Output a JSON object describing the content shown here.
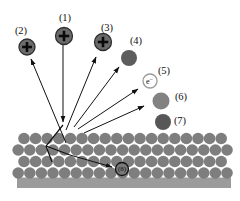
{
  "figure": {
    "background": "#ffffff",
    "width": 240,
    "height": 201,
    "line_color": "#111111",
    "label_font_size": 10.5,
    "labels": [
      {
        "name": "label-1",
        "text": "(1)",
        "x": 65,
        "y": 21
      },
      {
        "name": "label-2",
        "text": "(2)",
        "x": 21,
        "y": 34
      },
      {
        "name": "label-3",
        "text": "(3)",
        "x": 107,
        "y": 31
      },
      {
        "name": "label-4",
        "text": "(4)",
        "x": 136,
        "y": 44
      },
      {
        "name": "label-5",
        "text": "(5)",
        "x": 164,
        "y": 74
      },
      {
        "name": "label-6",
        "text": "(6)",
        "x": 181,
        "y": 100
      },
      {
        "name": "label-7",
        "text": "(7)",
        "x": 180,
        "y": 124
      }
    ],
    "particles": [
      {
        "name": "incident-ion-1",
        "cx": 64,
        "cy": 36,
        "r": 8.5,
        "fill": "#6b6b6b",
        "stroke": "#2f2f2f",
        "symbol": "plus"
      },
      {
        "name": "backscattered-ion-2",
        "cx": 27,
        "cy": 47,
        "r": 8,
        "fill": "#6b6b6b",
        "stroke": "#2f2f2f",
        "symbol": "plus"
      },
      {
        "name": "secondary-ion-3",
        "cx": 103,
        "cy": 42,
        "r": 8.5,
        "fill": "#6b6b6b",
        "stroke": "#2f2f2f",
        "symbol": "plus"
      },
      {
        "name": "sputtered-atom-4",
        "cx": 129,
        "cy": 58,
        "r": 8,
        "fill": "#5d5d5d",
        "stroke": "none",
        "symbol": "none"
      },
      {
        "name": "secondary-electron-5",
        "cx": 150,
        "cy": 81,
        "r": 7,
        "fill": "#ffffff",
        "stroke": "#9a9a9a",
        "symbol": "electron"
      },
      {
        "name": "sputtered-atom-6",
        "cx": 161,
        "cy": 101,
        "r": 8.5,
        "fill": "#828282",
        "stroke": "none",
        "symbol": "none"
      },
      {
        "name": "adatom-7",
        "cx": 163,
        "cy": 122,
        "r": 8,
        "fill": "#575757",
        "stroke": "none",
        "symbol": "none"
      },
      {
        "name": "implanted-ion-8",
        "cx": 122,
        "cy": 169,
        "r": 6.5,
        "fill": "#7a7a7a",
        "stroke": "#111111",
        "symbol": "text",
        "text": "(8)",
        "text_size": 7
      }
    ],
    "electron_label": {
      "base": "e",
      "sup": "−"
    },
    "arrows": [
      {
        "name": "arrow-incident-beam",
        "x1": 63,
        "y1": 45,
        "x2": 63,
        "y2": 122
      },
      {
        "name": "arrow-backscattered",
        "x1": 66,
        "y1": 143,
        "x2": 31,
        "y2": 59
      },
      {
        "name": "arrow-secondary-ion",
        "x1": 66,
        "y1": 130,
        "x2": 96,
        "y2": 57
      },
      {
        "name": "arrow-sputtered-4",
        "x1": 74,
        "y1": 127,
        "x2": 119,
        "y2": 67
      },
      {
        "name": "arrow-secondary-electron",
        "x1": 78,
        "y1": 129,
        "x2": 138,
        "y2": 89
      },
      {
        "name": "arrow-sputtered-6",
        "x1": 84,
        "y1": 133,
        "x2": 144,
        "y2": 106
      },
      {
        "name": "arrow-implantation",
        "x1": 70,
        "y1": 155,
        "x2": 112,
        "y2": 167
      }
    ],
    "cascade_paths": [
      {
        "name": "collision-cascade-main",
        "points": "63,125 46,146 52,162"
      },
      {
        "name": "collision-cascade-branch",
        "points": "46,146 70,155"
      }
    ],
    "lattice": {
      "fill": "#7e7e7e",
      "circle_r": 5.8,
      "spacing": 11.6,
      "rows": [
        {
          "y": 138.5,
          "startX": 24,
          "count": 18
        },
        {
          "y": 150,
          "startX": 18.2,
          "count": 19
        },
        {
          "y": 161.5,
          "startX": 24,
          "count": 18
        },
        {
          "y": 173,
          "startX": 18.2,
          "count": 19
        }
      ],
      "base_band": {
        "x": 17,
        "y": 177.5,
        "width": 214,
        "height": 10.5,
        "fill": "#9b9b9b"
      }
    }
  }
}
